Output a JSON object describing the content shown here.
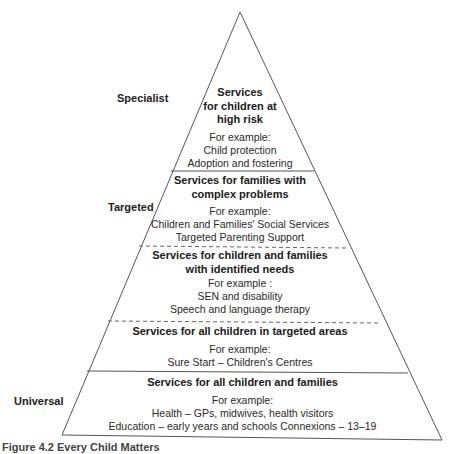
{
  "side_labels": {
    "specialist": "Specialist",
    "targeted": "Targeted",
    "universal": "Universal"
  },
  "tiers": [
    {
      "title_lines": [
        "Services",
        "for children at",
        "high risk"
      ],
      "example_label": "For example:",
      "examples": [
        "Child protection",
        "Adoption and fostering"
      ]
    },
    {
      "title_lines": [
        "Services for families with",
        "complex problems"
      ],
      "example_label": "For example:",
      "examples": [
        "Children and Families' Social Services",
        "Targeted Parenting Support"
      ]
    },
    {
      "title_lines": [
        "Services for children and families",
        "with identified needs"
      ],
      "example_label": "For example :",
      "examples": [
        "SEN and disability",
        "Speech and language therapy"
      ]
    },
    {
      "title_lines": [
        "Services for all children in targeted areas"
      ],
      "example_label": "For example:",
      "examples": [
        "Sure Start – Children's Centres"
      ]
    },
    {
      "title_lines": [
        "Services for all children and families"
      ],
      "example_label": "For example:",
      "examples": [
        "Health – GPs, midwives, health visitors",
        "Education – early years and schools Connexions – 13–19"
      ]
    }
  ],
  "dividers": [
    {
      "y": 171,
      "style": "solid"
    },
    {
      "y": 246,
      "style": "dashed"
    },
    {
      "y": 321,
      "style": "dashed"
    },
    {
      "y": 371,
      "style": "solid"
    }
  ],
  "caption": "Figure 4.2  Every Child Matters"
}
